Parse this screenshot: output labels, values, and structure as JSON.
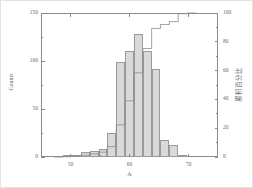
{
  "figure": {
    "background_color": "#ffffff",
    "frame_color": "#e3e3e3",
    "axis_color": "#8c8c8c",
    "bar_fill": "#d9d9d9",
    "bar_stroke": "#9a9a9a",
    "line_color": "#8c8c8c"
  },
  "axes": {
    "left": {
      "title": "Counts",
      "ticks": [
        "0",
        "50",
        "100",
        "150"
      ],
      "min": 0,
      "max": 150
    },
    "right": {
      "title": "累积百分比",
      "ticks": [
        "0",
        "20",
        "40",
        "60",
        "80",
        "100"
      ],
      "min": 0,
      "max": 100
    },
    "bottom": {
      "title": "A",
      "ticks": [
        "50",
        "60",
        "70"
      ],
      "min": 45,
      "max": 75
    }
  },
  "chart_data": {
    "type": "bar",
    "title": "",
    "xlabel": "A",
    "ylabel": "Counts",
    "y2label": "累积百分比",
    "xlim": [
      45,
      75
    ],
    "ylim": [
      0,
      150
    ],
    "y2lim": [
      0,
      100
    ],
    "grid": false,
    "legend": "none",
    "bin_width": 1.5,
    "x": [
      48.0,
      49.5,
      51.0,
      52.5,
      54.0,
      55.5,
      57.0,
      58.5,
      60.0,
      61.5,
      63.0,
      64.5,
      66.0,
      67.5,
      69.0,
      70.5
    ],
    "categories": [
      "48.0",
      "49.5",
      "51.0",
      "52.5",
      "54.0",
      "55.5",
      "57.0",
      "58.5",
      "60.0",
      "61.5",
      "63.0",
      "64.5",
      "66.0",
      "67.5",
      "69.0",
      "70.5"
    ],
    "values": [
      0,
      1,
      2,
      5,
      6,
      8,
      25,
      99,
      110,
      128,
      110,
      92,
      18,
      13,
      2,
      0
    ],
    "series": [
      {
        "name": "Counts",
        "type": "bar",
        "axis": "left",
        "values": [
          0,
          1,
          2,
          5,
          6,
          8,
          25,
          99,
          110,
          128,
          110,
          92,
          18,
          13,
          2,
          0
        ]
      },
      {
        "name": "累积百分比",
        "type": "step",
        "axis": "right",
        "values": [
          0.0,
          0.2,
          0.5,
          1.3,
          2.2,
          3.4,
          7.2,
          22.3,
          39.0,
          58.5,
          75.3,
          89.3,
          92.0,
          94.0,
          99.5,
          100.0
        ]
      }
    ]
  }
}
